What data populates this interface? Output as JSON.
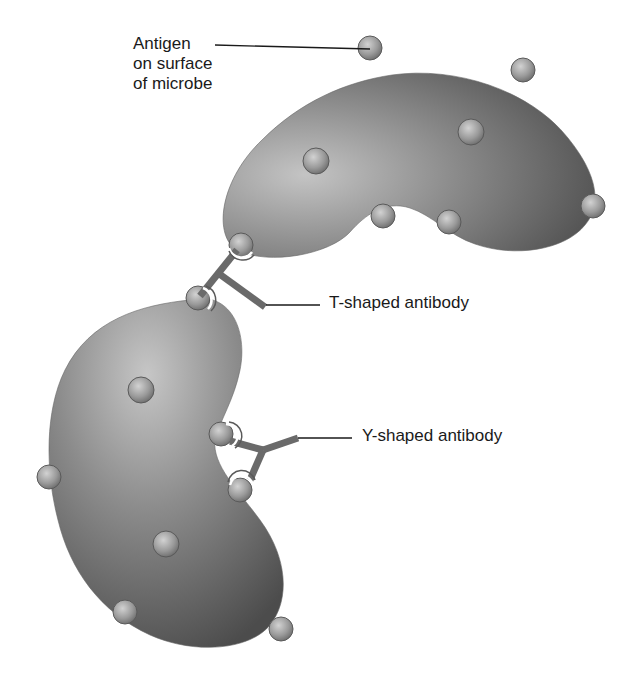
{
  "diagram": {
    "title": "",
    "labels": {
      "antigen": {
        "lines": [
          "Antigen",
          "on surface",
          "of microbe"
        ]
      },
      "t_antibody": "T-shaped antibody",
      "y_antibody": "Y-shaped antibody"
    },
    "components": {
      "microbes": [
        {
          "id": "upper-microbe",
          "shape": "kidney/bean",
          "fill": "#7a7a7a"
        },
        {
          "id": "lower-microbe",
          "shape": "kidney/bean",
          "fill": "#7a7a7a"
        }
      ],
      "antigen_count_upper": 8,
      "antigen_count_lower": 8,
      "antibodies": [
        {
          "id": "t-antibody",
          "shape": "T",
          "binds": [
            "upper-microbe",
            "lower-microbe"
          ]
        },
        {
          "id": "y-antibody",
          "shape": "Y",
          "binds": [
            "lower-microbe",
            "lower-microbe"
          ]
        }
      ]
    },
    "colors": {
      "background": "#ffffff",
      "microbe_light": "#bdbdbd",
      "microbe_mid": "#8a8a8a",
      "microbe_dark": "#555555",
      "antigen_light": "#c8c8c8",
      "antigen_dark": "#6e6e6e",
      "antibody": "#6a6a6a",
      "leader_line": "#1a1a1a",
      "text": "#1a1a1a"
    }
  }
}
